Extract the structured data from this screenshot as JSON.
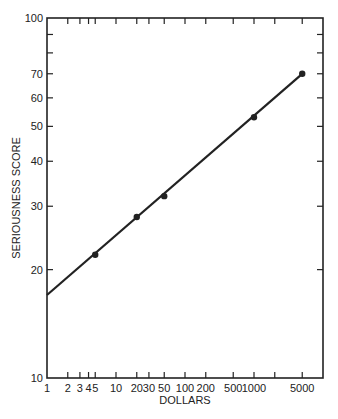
{
  "chart_data": {
    "type": "line",
    "title": "",
    "xlabel": "DOLLARS",
    "ylabel": "SERIOUSNESS SCORE",
    "x_scale": "log",
    "y_scale": "log",
    "xlim": [
      1,
      10000
    ],
    "ylim": [
      10,
      100
    ],
    "grid": false,
    "legend": null,
    "x_ticks": [
      {
        "value": 1,
        "label": "1"
      },
      {
        "value": 2,
        "label": "2"
      },
      {
        "value": 3,
        "label": "3"
      },
      {
        "value": 4,
        "label": "4"
      },
      {
        "value": 5,
        "label": "5"
      },
      {
        "value": 10,
        "label": "10"
      },
      {
        "value": 20,
        "label": "20"
      },
      {
        "value": 30,
        "label": "30"
      },
      {
        "value": 50,
        "label": "50"
      },
      {
        "value": 100,
        "label": "100"
      },
      {
        "value": 200,
        "label": "200"
      },
      {
        "value": 500,
        "label": "500"
      },
      {
        "value": 1000,
        "label": "1000"
      },
      {
        "value": 2000,
        "label": ""
      },
      {
        "value": 5000,
        "label": "5000"
      }
    ],
    "y_ticks": [
      {
        "value": 10,
        "label": "10"
      },
      {
        "value": 20,
        "label": "20"
      },
      {
        "value": 30,
        "label": "30"
      },
      {
        "value": 40,
        "label": "40"
      },
      {
        "value": 50,
        "label": "50"
      },
      {
        "value": 60,
        "label": "60"
      },
      {
        "value": 70,
        "label": "70"
      },
      {
        "value": 80,
        "label": ""
      },
      {
        "value": 90,
        "label": ""
      },
      {
        "value": 100,
        "label": "100"
      }
    ],
    "series": [
      {
        "name": "fitted line",
        "style": "line",
        "x": [
          1,
          5000
        ],
        "y": [
          17,
          70
        ]
      },
      {
        "name": "observations",
        "style": "markers",
        "x": [
          5,
          20,
          50,
          1000,
          5000
        ],
        "y": [
          22,
          28,
          32,
          53,
          70
        ]
      }
    ]
  },
  "colors": {
    "ink": "#222222",
    "background": "#ffffff"
  }
}
